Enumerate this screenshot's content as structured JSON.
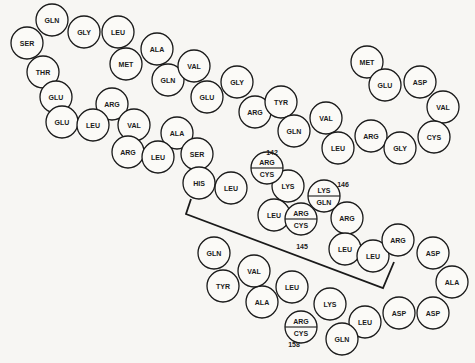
{
  "diagram": {
    "type": "protein-sequence-chain",
    "radius": 16,
    "residues": [
      {
        "label": "GLN",
        "x": 52,
        "y": 20
      },
      {
        "label": "SER",
        "x": 27,
        "y": 43
      },
      {
        "label": "GLY",
        "x": 84,
        "y": 32
      },
      {
        "label": "LEU",
        "x": 118,
        "y": 32
      },
      {
        "label": "THR",
        "x": 43,
        "y": 72
      },
      {
        "label": "MET",
        "x": 126,
        "y": 64
      },
      {
        "label": "ALA",
        "x": 157,
        "y": 49
      },
      {
        "label": "GLU",
        "x": 56,
        "y": 97
      },
      {
        "label": "ARG",
        "x": 112,
        "y": 104
      },
      {
        "label": "GLN",
        "x": 168,
        "y": 80
      },
      {
        "label": "VAL",
        "x": 194,
        "y": 66
      },
      {
        "label": "GLU",
        "x": 207,
        "y": 97
      },
      {
        "label": "GLU",
        "x": 62,
        "y": 122
      },
      {
        "label": "LEU",
        "x": 93,
        "y": 125
      },
      {
        "label": "VAL",
        "x": 134,
        "y": 125
      },
      {
        "label": "GLY",
        "x": 237,
        "y": 82
      },
      {
        "label": "ARG",
        "x": 255,
        "y": 112
      },
      {
        "label": "TYR",
        "x": 281,
        "y": 102
      },
      {
        "label": "ALA",
        "x": 177,
        "y": 133
      },
      {
        "label": "ARG",
        "x": 128,
        "y": 152
      },
      {
        "label": "LEU",
        "x": 158,
        "y": 157
      },
      {
        "label": "SER",
        "x": 197,
        "y": 154
      },
      {
        "label": "MET",
        "x": 367,
        "y": 62
      },
      {
        "label": "GLU",
        "x": 385,
        "y": 85
      },
      {
        "label": "ASP",
        "x": 420,
        "y": 82
      },
      {
        "label": "VAL",
        "x": 443,
        "y": 107
      },
      {
        "label": "VAL",
        "x": 326,
        "y": 118
      },
      {
        "label": "GLN",
        "x": 294,
        "y": 131
      },
      {
        "label": "LEU",
        "x": 338,
        "y": 148
      },
      {
        "label": "ARG",
        "x": 371,
        "y": 136
      },
      {
        "label": "GLY",
        "x": 400,
        "y": 148
      },
      {
        "label": "CYS",
        "x": 434,
        "y": 137
      },
      {
        "label": "HIS",
        "x": 199,
        "y": 183
      },
      {
        "label": "LEU",
        "x": 231,
        "y": 188
      },
      {
        "label": "LYS",
        "x": 288,
        "y": 186
      },
      {
        "label": "LEU",
        "x": 274,
        "y": 215
      },
      {
        "label": "ARG",
        "x": 347,
        "y": 218
      },
      {
        "label": "LEU",
        "x": 345,
        "y": 249
      },
      {
        "label": "LEU",
        "x": 373,
        "y": 256
      },
      {
        "label": "ARG",
        "x": 398,
        "y": 240
      },
      {
        "label": "ASP",
        "x": 433,
        "y": 253
      },
      {
        "label": "ALA",
        "x": 452,
        "y": 282
      },
      {
        "label": "ASP",
        "x": 433,
        "y": 313
      },
      {
        "label": "ASP",
        "x": 399,
        "y": 313
      },
      {
        "label": "LEU",
        "x": 365,
        "y": 322
      },
      {
        "label": "LYS",
        "x": 330,
        "y": 304
      },
      {
        "label": "GLN",
        "x": 342,
        "y": 339
      },
      {
        "label": "LEU",
        "x": 292,
        "y": 287
      },
      {
        "label": "ALA",
        "x": 262,
        "y": 302
      },
      {
        "label": "VAL",
        "x": 254,
        "y": 271
      },
      {
        "label": "TYR",
        "x": 223,
        "y": 286
      },
      {
        "label": "GLN",
        "x": 214,
        "y": 253
      }
    ],
    "split_residues": [
      {
        "top": "ARG",
        "bottom": "CYS",
        "x": 267,
        "y": 168
      },
      {
        "top": "ARG",
        "bottom": "CYS",
        "x": 301,
        "y": 219
      },
      {
        "top": "LYS",
        "bottom": "GLN",
        "x": 324,
        "y": 196
      },
      {
        "top": "ARG",
        "bottom": "CYS",
        "x": 301,
        "y": 327
      }
    ],
    "position_labels": [
      {
        "text": "142",
        "x": 272,
        "y": 152
      },
      {
        "text": "146",
        "x": 343,
        "y": 184
      },
      {
        "text": "145",
        "x": 302,
        "y": 246
      },
      {
        "text": "158",
        "x": 294,
        "y": 344
      }
    ],
    "bracket_points": "191,199 186,214 383,288 394,262"
  }
}
